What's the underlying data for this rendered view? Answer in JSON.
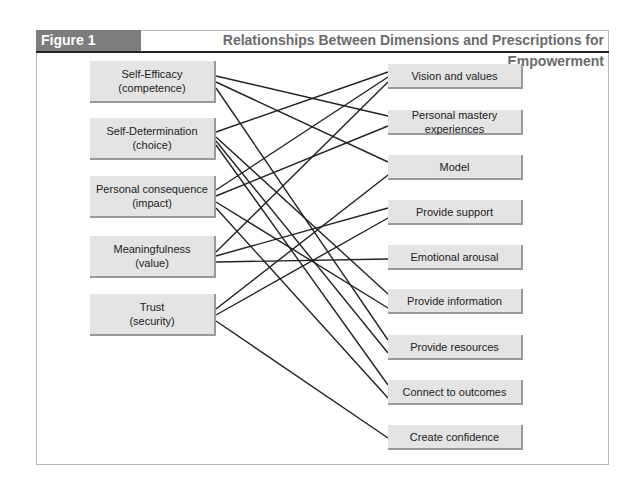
{
  "header": {
    "figure_label": "Figure 1",
    "title": "Relationships Between Dimensions and Prescriptions for Empowerment"
  },
  "dimensions": [
    {
      "line1": "Self-Efficacy",
      "line2": "(competence)"
    },
    {
      "line1": "Self-Determination",
      "line2": "(choice)"
    },
    {
      "line1": "Personal consequence",
      "line2": "(impact)"
    },
    {
      "line1": "Meaningfulness",
      "line2": "(value)"
    },
    {
      "line1": "Trust",
      "line2": "(security)"
    }
  ],
  "prescriptions": [
    {
      "label": "Vision and values"
    },
    {
      "label": "Personal mastery experiences"
    },
    {
      "label": "Model"
    },
    {
      "label": "Provide support"
    },
    {
      "label": "Emotional arousal"
    },
    {
      "label": "Provide information"
    },
    {
      "label": "Provide resources"
    },
    {
      "label": "Connect to outcomes"
    },
    {
      "label": "Create confidence"
    }
  ],
  "connections": [
    {
      "from": "Self-Efficacy",
      "to": "Personal mastery experiences"
    },
    {
      "from": "Self-Efficacy",
      "to": "Model"
    },
    {
      "from": "Self-Efficacy",
      "to": "Provide resources"
    },
    {
      "from": "Self-Determination",
      "to": "Vision and values"
    },
    {
      "from": "Self-Determination",
      "to": "Provide information"
    },
    {
      "from": "Self-Determination",
      "to": "Provide resources"
    },
    {
      "from": "Self-Determination",
      "to": "Connect to outcomes"
    },
    {
      "from": "Personal consequence",
      "to": "Vision and values"
    },
    {
      "from": "Personal consequence",
      "to": "Personal mastery experiences"
    },
    {
      "from": "Personal consequence",
      "to": "Provide information"
    },
    {
      "from": "Personal consequence",
      "to": "Connect to outcomes"
    },
    {
      "from": "Meaningfulness",
      "to": "Vision and values"
    },
    {
      "from": "Meaningfulness",
      "to": "Provide support"
    },
    {
      "from": "Meaningfulness",
      "to": "Emotional arousal"
    },
    {
      "from": "Trust",
      "to": "Model"
    },
    {
      "from": "Trust",
      "to": "Provide support"
    },
    {
      "from": "Trust",
      "to": "Create confidence"
    }
  ],
  "colors": {
    "header_label_bg": "#7d7d7d",
    "title_text": "#6b6b6b",
    "box_fill": "#e4e4e4",
    "box_shadow": "#9a9a9a",
    "line": "#222222"
  }
}
